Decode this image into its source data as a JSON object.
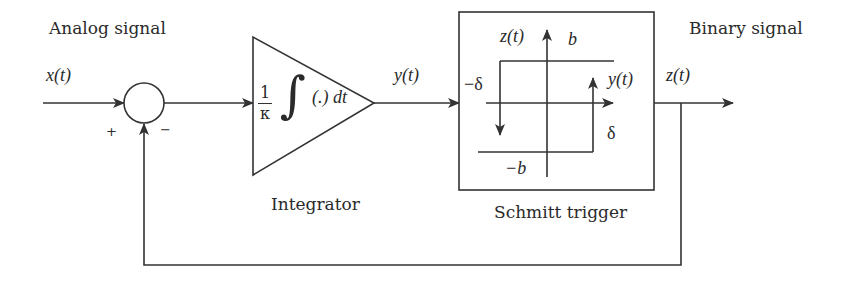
{
  "diagram": {
    "type": "block-diagram",
    "stroke_color": "#333333",
    "labels": {
      "input_title": "Analog signal",
      "output_title": "Binary signal",
      "input_signal": "x(t)",
      "integrator_out": "y(t)",
      "output_signal": "z(t)",
      "sum_plus": "+",
      "sum_minus": "−"
    },
    "integrator": {
      "name": "Integrator",
      "gain_num": "1",
      "gain_den": "κ",
      "integral_symbol": "∫",
      "integrand": "(.) dt"
    },
    "schmitt_trigger": {
      "name": "Schmitt trigger",
      "y_axis_label": "z(t)",
      "x_axis_label": "y(t)",
      "upper_level": "b",
      "lower_level": "−b",
      "neg_threshold": "−δ",
      "pos_threshold": "δ"
    },
    "connections": [
      {
        "from": "x(t)",
        "to": "summing-junction",
        "sign": "+"
      },
      {
        "from": "summing-junction",
        "to": "integrator"
      },
      {
        "from": "integrator",
        "to": "schmitt-trigger",
        "signal": "y(t)"
      },
      {
        "from": "schmitt-trigger",
        "to": "output",
        "signal": "z(t)"
      },
      {
        "from": "z(t)",
        "to": "summing-junction",
        "sign": "−",
        "type": "feedback"
      }
    ]
  }
}
